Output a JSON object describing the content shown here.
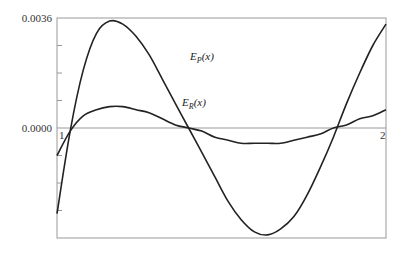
{
  "chart_data": {
    "type": "line",
    "title": "",
    "xlabel": "",
    "ylabel": "",
    "xlim": [
      1,
      2
    ],
    "ylim": [
      -0.0036,
      0.0036
    ],
    "grid": false,
    "legend": "inline labels on curves",
    "y_tick_labels": [
      "0.0036",
      "0.0000"
    ],
    "x_tick_labels": [
      "1",
      "2"
    ],
    "series": [
      {
        "name": "E_P(x)",
        "label_text": "E",
        "label_sub": "P",
        "label_suffix": "(x)",
        "x": [
          1.0,
          1.04,
          1.08,
          1.12,
          1.16,
          1.2,
          1.24,
          1.28,
          1.32,
          1.36,
          1.4,
          1.44,
          1.48,
          1.52,
          1.56,
          1.6,
          1.64,
          1.68,
          1.72,
          1.76,
          1.8,
          1.84,
          1.88,
          1.92,
          1.96,
          2.0
        ],
        "values": [
          -0.0028,
          -0.0001,
          0.0019,
          0.0031,
          0.0035,
          0.0034,
          0.003,
          0.0024,
          0.0016,
          0.0008,
          0.0,
          -0.0008,
          -0.0016,
          -0.0024,
          -0.003,
          -0.0034,
          -0.0035,
          -0.0033,
          -0.0029,
          -0.0022,
          -0.0013,
          -0.0003,
          0.0008,
          0.0018,
          0.0027,
          0.0034
        ]
      },
      {
        "name": "E_R(x)",
        "label_text": "E",
        "label_sub": "R",
        "label_suffix": "(x)",
        "x": [
          1.0,
          1.04,
          1.08,
          1.12,
          1.16,
          1.2,
          1.24,
          1.28,
          1.32,
          1.36,
          1.4,
          1.44,
          1.48,
          1.52,
          1.56,
          1.6,
          1.64,
          1.68,
          1.72,
          1.76,
          1.8,
          1.84,
          1.88,
          1.92,
          1.96,
          2.0
        ],
        "values": [
          -0.0009,
          -0.0001,
          0.0004,
          0.0006,
          0.0007,
          0.0007,
          0.0006,
          0.0005,
          0.0003,
          0.0001,
          0.0,
          -0.0001,
          -0.0003,
          -0.0004,
          -0.0005,
          -0.0005,
          -0.0005,
          -0.0005,
          -0.0004,
          -0.0003,
          -0.0002,
          0.0,
          0.0001,
          0.0003,
          0.0004,
          0.0006
        ]
      }
    ]
  },
  "colors": {
    "curve": "#222222",
    "frame": "#999999",
    "zero_line": "#999999"
  }
}
